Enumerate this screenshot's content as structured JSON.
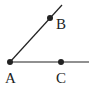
{
  "diagram": {
    "type": "angle",
    "points": {
      "A": {
        "label": "A",
        "x": 10,
        "y": 62
      },
      "B": {
        "label": "B",
        "x": 50,
        "y": 18
      },
      "C": {
        "label": "C",
        "x": 61,
        "y": 62
      }
    },
    "rays": [
      {
        "name": "ray-AB",
        "from": "A",
        "through": "B"
      },
      {
        "name": "ray-AC",
        "from": "A",
        "through": "C"
      }
    ],
    "colors": {
      "stroke": "#222222",
      "background": "#ffffff"
    }
  }
}
